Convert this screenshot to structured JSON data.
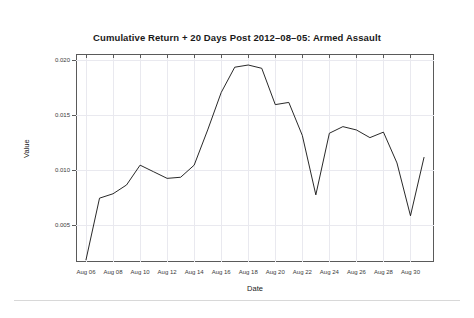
{
  "chart_data": {
    "type": "line",
    "title": "Cumulative Return + 20 Days Post 2012–08–05: Armed Assault",
    "xlabel": "Date",
    "ylabel": "Value",
    "grid": true,
    "legend": null,
    "ylim": [
      0.0016,
      0.0205
    ],
    "yticks": [
      0.005,
      0.01,
      0.015,
      0.02
    ],
    "ytick_labels": [
      "0.005",
      "0.010",
      "0.015",
      "0.020"
    ],
    "xticks": [
      "Aug 06",
      "Aug 08",
      "Aug 10",
      "Aug 12",
      "Aug 14",
      "Aug 16",
      "Aug 18",
      "Aug 20",
      "Aug 22",
      "Aug 24",
      "Aug 26",
      "Aug 28",
      "Aug 30"
    ],
    "line_color": "#111111",
    "x": [
      "Aug 06",
      "Aug 07",
      "Aug 08",
      "Aug 09",
      "Aug 10",
      "Aug 11",
      "Aug 12",
      "Aug 13",
      "Aug 14",
      "Aug 15",
      "Aug 16",
      "Aug 17",
      "Aug 18",
      "Aug 19",
      "Aug 20",
      "Aug 21",
      "Aug 22",
      "Aug 23",
      "Aug 24",
      "Aug 25",
      "Aug 26",
      "Aug 27",
      "Aug 28",
      "Aug 29",
      "Aug 30",
      "Aug 31"
    ],
    "values": [
      0.0018,
      0.0074,
      0.0078,
      0.0086,
      0.0104,
      0.0098,
      0.0092,
      0.0093,
      0.0104,
      0.0136,
      0.017,
      0.0193,
      0.0195,
      0.0192,
      0.0159,
      0.0161,
      0.0131,
      0.0077,
      0.0133,
      0.0139,
      0.0136,
      0.0129,
      0.0134,
      0.0106,
      0.0058,
      0.0111
    ]
  },
  "axis": {
    "y_title": "Value",
    "x_title": "Date"
  }
}
